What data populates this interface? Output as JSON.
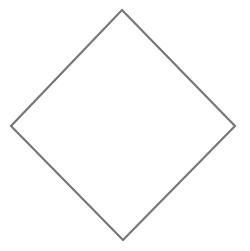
{
  "diagram": {
    "background": "#ffffff",
    "shapes": [
      {
        "type": "diamond",
        "name": "diamond-shape",
        "vertices": {
          "top": [
            122,
            10
          ],
          "right": [
            235,
            126
          ],
          "bottom": [
            123,
            240
          ],
          "left": [
            11,
            126
          ]
        },
        "stroke": "#777777",
        "stroke_width": 2.2,
        "fill": "none"
      }
    ]
  }
}
